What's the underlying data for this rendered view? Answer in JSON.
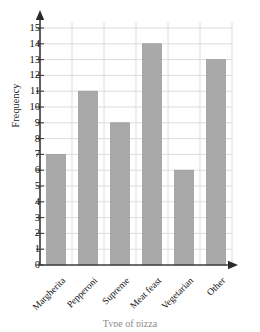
{
  "chart_data": {
    "type": "bar",
    "title": "",
    "xlabel": "Type of pizza",
    "ylabel": "Frequency",
    "categories": [
      "Margherita",
      "Pepperoni",
      "Supreme",
      "Meat feast",
      "Vegetarian",
      "Other"
    ],
    "values": [
      7,
      11,
      9,
      14,
      6,
      13
    ],
    "ylim": [
      0,
      15
    ],
    "ytick_labels": [
      "0",
      "1",
      "2",
      "3",
      "4",
      "5",
      "6",
      "7",
      "8",
      "9",
      "10",
      "11",
      "12",
      "13",
      "14",
      "15"
    ],
    "ytick_step": 1,
    "grid": true,
    "legend": false,
    "bar_color": "#a9a9a9",
    "bar_edge_color": "#9a9a9a",
    "grid_color": "#dcdcdc",
    "axis_color": "#3c3c3c"
  }
}
